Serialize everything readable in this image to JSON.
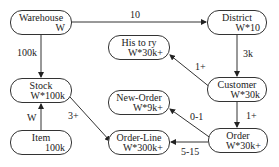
{
  "diagram": {
    "type": "entity-relationship",
    "nodes": [
      {
        "id": "warehouse",
        "name": "Warehouse",
        "cardinality": "W"
      },
      {
        "id": "district",
        "name": "District",
        "cardinality": "W*10"
      },
      {
        "id": "history",
        "name": "His to ry",
        "cardinality": "W*30k+"
      },
      {
        "id": "customer",
        "name": "Customer",
        "cardinality": "W*30k"
      },
      {
        "id": "stock",
        "name": "Stock",
        "cardinality": "W*100k"
      },
      {
        "id": "new_order",
        "name": "New-Order",
        "cardinality": "W*9k+"
      },
      {
        "id": "item",
        "name": "Item",
        "cardinality": "100k"
      },
      {
        "id": "order_line",
        "name": "Order-Line",
        "cardinality": "W*300k+"
      },
      {
        "id": "order",
        "name": "Order",
        "cardinality": "W*30k+"
      }
    ],
    "edges": [
      {
        "from": "warehouse",
        "to": "district",
        "label": "10"
      },
      {
        "from": "warehouse",
        "to": "stock",
        "label": "100k"
      },
      {
        "from": "district",
        "to": "customer",
        "label": "3k"
      },
      {
        "from": "customer",
        "to": "history",
        "label": "1+"
      },
      {
        "from": "customer",
        "to": "order",
        "label": "1+"
      },
      {
        "from": "item",
        "to": "stock",
        "label": "W"
      },
      {
        "from": "stock",
        "to": "order_line",
        "label": "3+"
      },
      {
        "from": "order",
        "to": "new_order",
        "label": "0-1"
      },
      {
        "from": "order",
        "to": "order_line",
        "label": "5-15"
      }
    ]
  }
}
